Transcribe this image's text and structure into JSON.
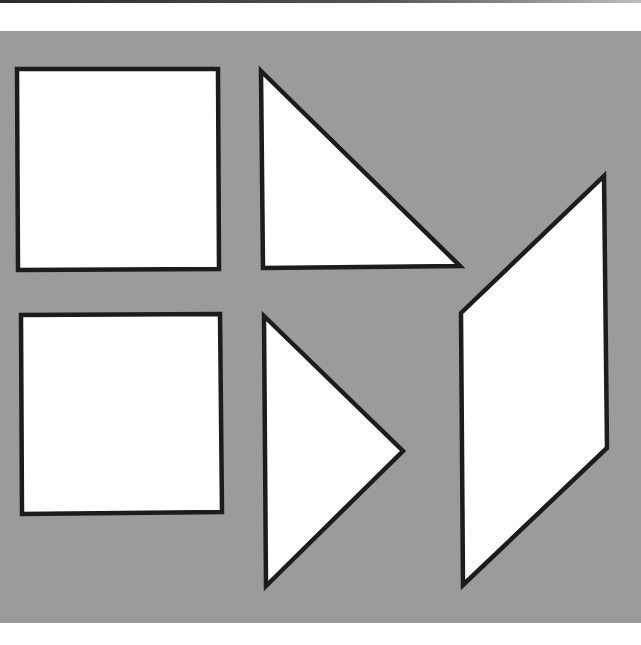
{
  "figure": {
    "title": "",
    "background_color": "#9b9b9b",
    "shape_fill": "#ffffff",
    "shape_stroke": "#1c1c1c",
    "shapes": [
      {
        "id": "square-1",
        "kind": "square"
      },
      {
        "id": "triangle-1",
        "kind": "right-triangle"
      },
      {
        "id": "square-2",
        "kind": "square"
      },
      {
        "id": "triangle-2",
        "kind": "right-triangle"
      },
      {
        "id": "parallelogram-1",
        "kind": "parallelogram"
      }
    ]
  }
}
